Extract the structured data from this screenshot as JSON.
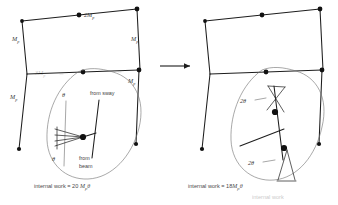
{
  "figure": {
    "title_partial": "internal work",
    "arrow": "right-arrow"
  },
  "left_panel": {
    "name": "beam-mechanism",
    "caption_prefix": "internal work = 20 ",
    "caption_symbol": "M",
    "caption_sub": "p",
    "caption_theta": "θ",
    "caption_full": "internal work = 20 Mₚθ",
    "member_labels": [
      {
        "text": "M",
        "sub": "p",
        "x": 12,
        "y": 41,
        "name": "label-mp-upper-left-column"
      },
      {
        "text": "2M",
        "sub": "p",
        "x": 84,
        "y": 17,
        "name": "label-2mp-top-beam"
      },
      {
        "text": "M",
        "sub": "p",
        "x": 131,
        "y": 41,
        "name": "label-mp-upper-right-column"
      },
      {
        "text": "3M",
        "sub": "p",
        "x": 35,
        "y": 75,
        "name": "label-3mp-mid-beam"
      },
      {
        "text": "M",
        "sub": "p",
        "x": 128,
        "y": 83,
        "name": "label-mp-lower-right-column"
      },
      {
        "text": "M",
        "sub": "p",
        "x": 10,
        "y": 99,
        "name": "label-mp-lower-left-column"
      }
    ],
    "angle_labels": [
      {
        "text": "θ",
        "x": 62,
        "y": 97,
        "name": "label-theta-top"
      },
      {
        "text": "θ",
        "x": 52,
        "y": 161,
        "name": "label-theta-bottom"
      }
    ],
    "notes": [
      {
        "line1": "from sway",
        "x": 90,
        "y": 95,
        "name": "note-from-sway"
      },
      {
        "line1": "from",
        "line2": "beam",
        "x": 79,
        "y": 160,
        "name": "note-from-beam"
      }
    ]
  },
  "right_panel": {
    "name": "combined-mechanism",
    "caption_prefix": "internal work = 18",
    "caption_symbol": "M",
    "caption_sub": "p",
    "caption_theta": "θ",
    "caption_full": "internal work = 18Mₚθ",
    "angle_labels": [
      {
        "text": "2θ",
        "x": 243,
        "y": 102,
        "name": "label-2theta-upper"
      },
      {
        "text": "2θ",
        "x": 250,
        "y": 164,
        "name": "label-2theta-lower"
      }
    ]
  },
  "colors": {
    "ink": "#1d1d1d",
    "hinge": "#111111",
    "label": "#3a3a3a",
    "bubble": "#6e6e6e",
    "background": "#ffffff"
  }
}
